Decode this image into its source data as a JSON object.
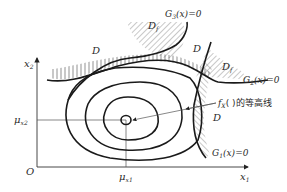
{
  "figure": {
    "type": "limit-state-surfaces-with-joint-pdf-contours",
    "axes": {
      "x_label": "x",
      "x_label_sub": "1",
      "y_label": "x",
      "y_label_sub": "2",
      "origin_label": "O"
    },
    "mean_point": {
      "x_label": "μ",
      "x_label_sub": "x1",
      "y_label": "μ",
      "y_label_sub": "x2"
    },
    "limit_states": [
      {
        "name": "G",
        "sub": "1",
        "rest": "(x)=0"
      },
      {
        "name": "G",
        "sub": "2",
        "rest": "(x)=0"
      },
      {
        "name": "G",
        "sub": "3",
        "rest": "(x)=0"
      }
    ],
    "regions": {
      "safe": "D",
      "failure": "D",
      "failure_sub": "f"
    },
    "contour_annotation": {
      "func": "f",
      "func_sub": "X",
      "rest": "( )的等高线"
    },
    "colors": {
      "line": "#1a1a1a",
      "text": "#2a2a2a",
      "background": "#ffffff"
    }
  }
}
